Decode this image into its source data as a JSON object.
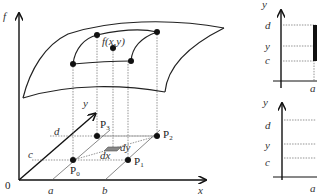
{
  "main_diagram": {
    "axes": {
      "vertical": "f",
      "depth": "y",
      "horizontal": "x",
      "origin": "0"
    },
    "surface_label": "f(x,y)",
    "x_ticks": [
      "a",
      "b"
    ],
    "y_ticks": [
      "c",
      "d"
    ],
    "points": [
      {
        "name": "P",
        "sub": "0"
      },
      {
        "name": "P",
        "sub": "1"
      },
      {
        "name": "P",
        "sub": "2"
      },
      {
        "name": "P",
        "sub": "3"
      }
    ],
    "element": {
      "dx": "dx",
      "dy": "dy"
    }
  },
  "side_top": {
    "y_axis": "y",
    "ticks": [
      "d",
      "y",
      "c"
    ],
    "x_tick": "a"
  },
  "side_bottom": {
    "y_axis": "y",
    "ticks": [
      "d",
      "y",
      "c"
    ],
    "x_tick": "a"
  }
}
